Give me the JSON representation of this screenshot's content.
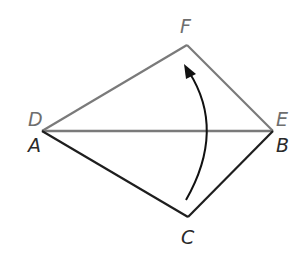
{
  "diagram": {
    "colors": {
      "image_triangle": "#7a7a7a",
      "preimage_triangle": "#1e1e1e",
      "arrow": "#111111",
      "background": "#ffffff"
    },
    "points": {
      "A": {
        "label": "A",
        "x": 42,
        "y": 131
      },
      "B": {
        "label": "B",
        "x": 273,
        "y": 131
      },
      "C": {
        "label": "C",
        "x": 188,
        "y": 217
      },
      "D": {
        "label": "D",
        "x": 42,
        "y": 131
      },
      "E": {
        "label": "E",
        "x": 273,
        "y": 131
      },
      "F": {
        "label": "F",
        "x": 187,
        "y": 45
      }
    },
    "labels": {
      "F": "F",
      "D": "D",
      "E": "E",
      "A": "A",
      "B": "B",
      "C": "C"
    },
    "triangles": [
      {
        "name": "DEF",
        "vertices": [
          "D",
          "E",
          "F"
        ],
        "style": "gray"
      },
      {
        "name": "ABC",
        "vertices": [
          "A",
          "B",
          "C"
        ],
        "style": "black"
      }
    ],
    "arrow": {
      "from": "C",
      "to": "F",
      "shape": "curved"
    }
  }
}
